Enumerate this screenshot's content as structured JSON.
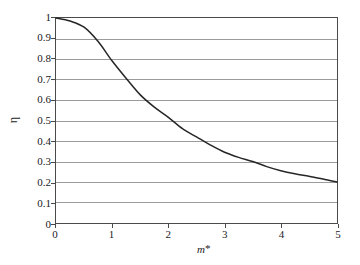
{
  "chart_data": {
    "type": "line",
    "title": "",
    "xlabel": "m*",
    "ylabel": "η",
    "xlim": [
      0,
      5
    ],
    "ylim": [
      0,
      1
    ],
    "grid": "horizontal",
    "legend": "none",
    "xticks": [
      "0",
      "1",
      "2",
      "3",
      "4",
      "5"
    ],
    "xtick_values": [
      0,
      1,
      2,
      3,
      4,
      5
    ],
    "yticks": [
      "0",
      "0.1",
      "0.2",
      "0.3",
      "0.4",
      "0.5",
      "0.6",
      "0.7",
      "0.8",
      "0.9",
      "1"
    ],
    "ytick_values": [
      0,
      0.1,
      0.2,
      0.3,
      0.4,
      0.5,
      0.6,
      0.7,
      0.8,
      0.9,
      1
    ],
    "series": [
      {
        "name": "η(m*)",
        "color": "#262626",
        "x": [
          0,
          0.25,
          0.5,
          0.75,
          1,
          1.25,
          1.5,
          1.75,
          2,
          2.25,
          2.5,
          2.75,
          3,
          3.25,
          3.5,
          3.75,
          4,
          4.25,
          4.5,
          4.75,
          5
        ],
        "values": [
          1.0,
          0.985,
          0.955,
          0.885,
          0.79,
          0.705,
          0.625,
          0.565,
          0.515,
          0.46,
          0.42,
          0.38,
          0.345,
          0.32,
          0.3,
          0.275,
          0.255,
          0.24,
          0.228,
          0.215,
          0.2
        ]
      }
    ]
  },
  "style": {
    "grid_color": "#9a9a9a",
    "frame_color": "#4a4a4a",
    "curve_color": "#262626",
    "background": "#ffffff"
  }
}
